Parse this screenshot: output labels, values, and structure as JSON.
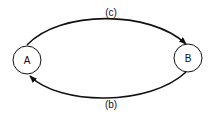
{
  "diagram": {
    "type": "state-transition",
    "colors": {
      "stroke": "#111111",
      "node_fill": "#ffffff",
      "background": "#ffffff"
    },
    "nodes": [
      {
        "id": "A",
        "label": "A"
      },
      {
        "id": "B",
        "label": "B"
      }
    ],
    "edges": [
      {
        "from": "A",
        "to": "B",
        "label": "(c)",
        "position": "top"
      },
      {
        "from": "B",
        "to": "A",
        "label": "(b)",
        "position": "bottom"
      }
    ]
  }
}
